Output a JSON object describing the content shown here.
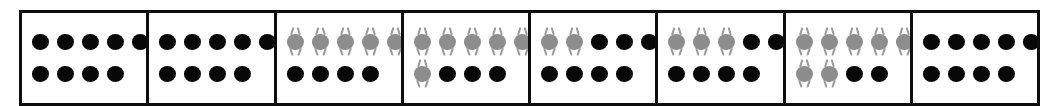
{
  "figure": {
    "title": "",
    "panel_count": 8,
    "items_per_panel": 9,
    "top_row_slots": 5,
    "bottom_row_slots": 4,
    "colors": {
      "border": "#0d0d0d",
      "background": "#ffffff",
      "black_dot": "#080808",
      "gray_dot": "#8d8d8d",
      "limb": "#9a9a9a"
    },
    "marker_types": {
      "black": "plain-dot",
      "gray": "antenna-dot"
    }
  },
  "chart_data": {
    "type": "table",
    "title": "",
    "xlabel": "",
    "ylabel": "",
    "categories": [
      "1",
      "2",
      "3",
      "4",
      "5",
      "6",
      "7",
      "8"
    ],
    "series": [
      {
        "name": "gray dots",
        "values": [
          0,
          0,
          5,
          6,
          2,
          3,
          7,
          0
        ]
      },
      {
        "name": "black dots",
        "values": [
          9,
          9,
          4,
          3,
          7,
          6,
          2,
          9
        ]
      }
    ],
    "legend_position": "none",
    "grid": false
  },
  "panels": [
    {
      "index": 1,
      "gray_count": 0,
      "black_count": 9,
      "rows": [
        [
          "black",
          "black",
          "black",
          "black",
          "black"
        ],
        [
          "black",
          "black",
          "black",
          "black",
          "empty"
        ]
      ]
    },
    {
      "index": 2,
      "gray_count": 0,
      "black_count": 9,
      "rows": [
        [
          "black",
          "black",
          "black",
          "black",
          "black"
        ],
        [
          "black",
          "black",
          "black",
          "black",
          "empty"
        ]
      ]
    },
    {
      "index": 3,
      "gray_count": 5,
      "black_count": 4,
      "rows": [
        [
          "gray",
          "gray",
          "gray",
          "gray",
          "gray"
        ],
        [
          "black",
          "black",
          "black",
          "black",
          "empty"
        ]
      ]
    },
    {
      "index": 4,
      "gray_count": 6,
      "black_count": 3,
      "rows": [
        [
          "gray",
          "gray",
          "gray",
          "gray",
          "gray"
        ],
        [
          "gray",
          "black",
          "black",
          "black",
          "empty"
        ]
      ]
    },
    {
      "index": 5,
      "gray_count": 2,
      "black_count": 7,
      "rows": [
        [
          "gray",
          "gray",
          "black",
          "black",
          "black"
        ],
        [
          "black",
          "black",
          "black",
          "black",
          "empty"
        ]
      ]
    },
    {
      "index": 6,
      "gray_count": 3,
      "black_count": 6,
      "rows": [
        [
          "gray",
          "gray",
          "gray",
          "black",
          "black"
        ],
        [
          "black",
          "black",
          "black",
          "black",
          "empty"
        ]
      ]
    },
    {
      "index": 7,
      "gray_count": 7,
      "black_count": 2,
      "rows": [
        [
          "gray",
          "gray",
          "gray",
          "gray",
          "gray"
        ],
        [
          "gray",
          "gray",
          "black",
          "black",
          "empty"
        ]
      ]
    },
    {
      "index": 8,
      "gray_count": 0,
      "black_count": 9,
      "rows": [
        [
          "black",
          "black",
          "black",
          "black",
          "black"
        ],
        [
          "black",
          "black",
          "black",
          "black",
          "empty"
        ]
      ]
    }
  ]
}
